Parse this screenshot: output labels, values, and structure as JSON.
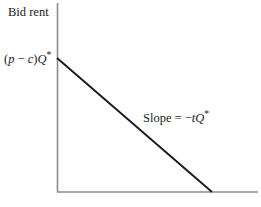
{
  "figure": {
    "background_color": "#ffffff",
    "axis_color": "#8c8c8c",
    "line_color": "#1a1a1a",
    "y_axis_title": "Bid rent",
    "intercept_label": {
      "open_paren": "(",
      "p": "p",
      "minus": " − ",
      "c": "c",
      "close_paren": ")",
      "Q": "Q",
      "star": "*"
    },
    "slope_label": {
      "prefix": "Slope = ",
      "minus": "−",
      "t": "t",
      "Q": "Q",
      "star": "*"
    }
  },
  "chart_data": {
    "type": "line",
    "title": "",
    "subtitle": "",
    "xlabel": "",
    "ylabel": "Bid rent",
    "grid": false,
    "legend": "none",
    "annotations": [
      {
        "name": "y-axis-title",
        "text": "Bid rent",
        "x_px": 8,
        "y_px": 6
      },
      {
        "name": "y-intercept-label",
        "text": "(p − c)Q*",
        "x_px": 4,
        "y_px": 50
      },
      {
        "name": "slope-annotation",
        "text": "Slope = −tQ*",
        "x_px": 143,
        "y_px": 109
      }
    ],
    "axes_px": {
      "y_axis_x": 57,
      "y_axis_top": 3,
      "y_axis_bottom": 192,
      "x_axis_y": 192,
      "x_axis_left": 57,
      "x_axis_right": 258
    },
    "series": [
      {
        "name": "Bid rent function",
        "points_px": [
          {
            "x": 57,
            "y": 58
          },
          {
            "x": 212,
            "y": 192
          }
        ],
        "y_intercept": "(p − c)Q*",
        "slope": "−tQ*",
        "x_intercept_px": 212
      }
    ]
  }
}
